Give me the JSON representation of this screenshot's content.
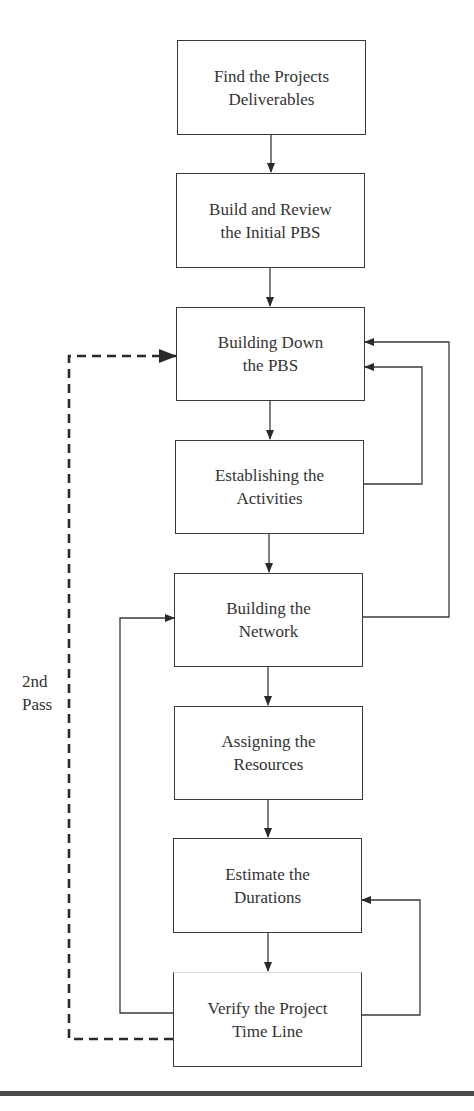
{
  "diagram": {
    "type": "flowchart",
    "steps": [
      {
        "id": "s1",
        "label": "Find the Projects\nDeliverables"
      },
      {
        "id": "s2",
        "label": "Build and Review\nthe Initial PBS"
      },
      {
        "id": "s3",
        "label": "Building Down\nthe PBS"
      },
      {
        "id": "s4",
        "label": "Establishing the\nActivities"
      },
      {
        "id": "s5",
        "label": "Building the\nNetwork"
      },
      {
        "id": "s6",
        "label": "Assigning the\nResources"
      },
      {
        "id": "s7",
        "label": "Estimate the\nDurations"
      },
      {
        "id": "s8",
        "label": "Verify the Project\nTime Line"
      }
    ],
    "edges": [
      {
        "from": "s1",
        "to": "s2",
        "style": "solid"
      },
      {
        "from": "s2",
        "to": "s3",
        "style": "solid"
      },
      {
        "from": "s3",
        "to": "s4",
        "style": "solid"
      },
      {
        "from": "s4",
        "to": "s5",
        "style": "solid"
      },
      {
        "from": "s5",
        "to": "s6",
        "style": "solid"
      },
      {
        "from": "s6",
        "to": "s7",
        "style": "solid"
      },
      {
        "from": "s7",
        "to": "s8",
        "style": "solid"
      },
      {
        "from": "s4",
        "to": "s3",
        "style": "solid",
        "route": "right-inner"
      },
      {
        "from": "s5",
        "to": "s3",
        "style": "solid",
        "route": "right-outer"
      },
      {
        "from": "s8",
        "to": "s5",
        "style": "solid",
        "route": "left"
      },
      {
        "from": "s8",
        "to": "s7",
        "style": "solid",
        "route": "right"
      },
      {
        "from": "s8",
        "to": "s3",
        "style": "dashed",
        "route": "left-outer",
        "label": "2nd Pass"
      }
    ],
    "side_label": "2nd\nPass",
    "colors": {
      "line": "#3a3a3a",
      "text": "#333333",
      "rule": "#4a4a4a"
    }
  }
}
